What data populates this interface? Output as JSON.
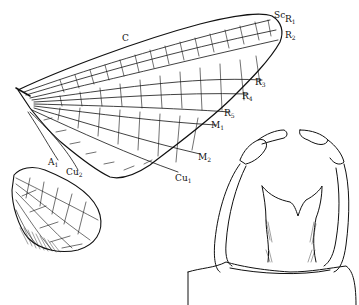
{
  "figure": {
    "components": [
      "forewing",
      "hindwing",
      "forceps / genitalia"
    ]
  },
  "labels": {
    "C": {
      "base": "C",
      "sub": ""
    },
    "Sc": {
      "base": "Sc",
      "sub": ""
    },
    "R1": {
      "base": "R",
      "sub": "1"
    },
    "R2": {
      "base": "R",
      "sub": "2"
    },
    "R3": {
      "base": "R",
      "sub": "3"
    },
    "R4": {
      "base": "R",
      "sub": "4"
    },
    "R5": {
      "base": "R",
      "sub": "5"
    },
    "M1": {
      "base": "M",
      "sub": "1"
    },
    "M2": {
      "base": "M",
      "sub": "2"
    },
    "Cu1": {
      "base": "Cu",
      "sub": "1"
    },
    "Cu2": {
      "base": "Cu",
      "sub": "2"
    },
    "A1": {
      "base": "A",
      "sub": "1"
    }
  },
  "colors": {
    "ink": "#111111",
    "background": "#ffffff"
  }
}
